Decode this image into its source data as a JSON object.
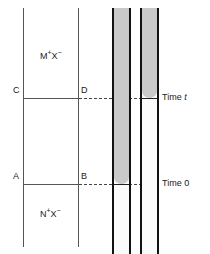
{
  "figure": {
    "type": "scientific-diagram",
    "width": 210,
    "height": 254,
    "background_color": "#ffffff"
  },
  "cell": {
    "upper_region_label": "M",
    "upper_region_cation_charge": "+",
    "upper_region_anion": "X",
    "upper_region_anion_charge": "−",
    "lower_region_label": "N",
    "lower_region_cation_charge": "+",
    "lower_region_anion": "X",
    "lower_region_anion_charge": "−",
    "boundary_points": {
      "c": "C",
      "d": "D",
      "a": "A",
      "b": "B"
    },
    "wall_color": "#555555",
    "boundary_color": "#555555"
  },
  "tubes": [
    {
      "name": "tube-left",
      "fill_level_label": "Time 0",
      "fill_color": "#c9c9c9",
      "wall_color": "#111111",
      "bore_color": "#fbfbfb"
    },
    {
      "name": "tube-right",
      "fill_level_label": "Time t",
      "fill_color": "#c9c9c9",
      "wall_color": "#111111",
      "bore_color": "#fbfbfb"
    }
  ],
  "time_markers": [
    {
      "id": "time-t",
      "prefix": "Time ",
      "value": "t",
      "italic_value": true
    },
    {
      "id": "time-0",
      "prefix": "Time ",
      "value": "0",
      "italic_value": false
    }
  ],
  "leaders": {
    "style": "dashed",
    "color": "#444444"
  }
}
